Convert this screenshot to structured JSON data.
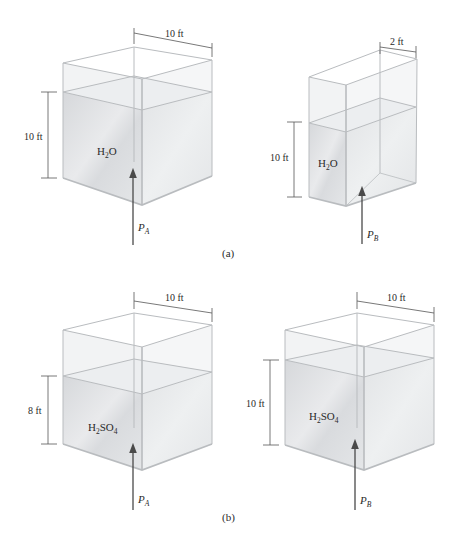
{
  "figure": {
    "parts": [
      {
        "id": "a",
        "caption": "(a)",
        "tanks": [
          {
            "name": "tank-a-left",
            "liquid": {
              "base": "H",
              "sub1": "2",
              "rest": "O",
              "formula": "H2O"
            },
            "width_label": "10 ft",
            "depth_label": "10 ft",
            "pressure": {
              "symbol": "P",
              "subscript": "A"
            }
          },
          {
            "name": "tank-a-right",
            "liquid": {
              "base": "H",
              "sub1": "2",
              "rest": "O",
              "formula": "H2O"
            },
            "width_label": "2 ft",
            "depth_label": "10 ft",
            "pressure": {
              "symbol": "P",
              "subscript": "B"
            }
          }
        ]
      },
      {
        "id": "b",
        "caption": "(b)",
        "tanks": [
          {
            "name": "tank-b-left",
            "liquid": {
              "base": "H",
              "sub1": "2",
              "mid": "SO",
              "sub2": "4",
              "formula": "H2SO4"
            },
            "width_label": "10 ft",
            "depth_label": "8 ft",
            "pressure": {
              "symbol": "P",
              "subscript": "A"
            }
          },
          {
            "name": "tank-b-right",
            "liquid": {
              "base": "H",
              "sub1": "2",
              "mid": "SO",
              "sub2": "4",
              "formula": "H2SO4"
            },
            "width_label": "10 ft",
            "depth_label": "10 ft",
            "pressure": {
              "symbol": "P",
              "subscript": "B"
            }
          }
        ]
      }
    ],
    "colors": {
      "edge": "#b9bcbf",
      "liquid": "#dcdee0",
      "liquid_side": "#e6e8ea",
      "air": "#f3f4f5",
      "dim_line": "#555555",
      "arrow": "#4a4a4a"
    }
  }
}
